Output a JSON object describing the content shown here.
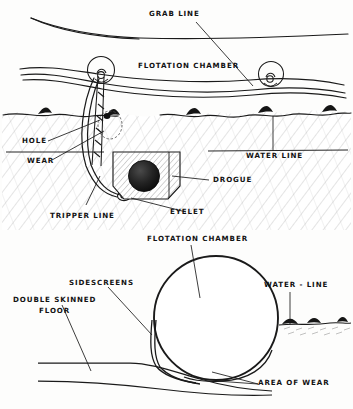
{
  "figure": {
    "title_visible": false,
    "style": "hand-drawn pen-and-ink technical illustration",
    "views": [
      {
        "name": "side-elevation",
        "description": "liferaft floating at water line with drogue deployed"
      },
      {
        "name": "cross-section",
        "description": "sectional view through flotation chamber and floor"
      }
    ]
  },
  "upper_diagram": {
    "labels": {
      "grab_line": "GRAB LINE",
      "flotation_chamber": "FLOTATION CHAMBER",
      "hole": "HOLE",
      "wear": "WEAR",
      "tripper_line": "TRIPPER LINE",
      "eyelet": "EYELET",
      "drogue": "DROGUE",
      "water_line": "WATER LINE"
    }
  },
  "lower_diagram": {
    "labels": {
      "flotation_chamber": "FLOTATION CHAMBER",
      "sidescreens": "SIDESCREENS",
      "double_skinned_floor_line1": "DOUBLE SKINNED",
      "double_skinned_floor_line2": "FLOOR",
      "water_line": "WATER - LINE",
      "area_of_wear": "AREA OF WEAR"
    }
  },
  "colors": {
    "ink": "#1a1a1a",
    "paper": "#fdfdfc",
    "hatch": "#6f6f6f",
    "wave_fill": "#151515"
  }
}
